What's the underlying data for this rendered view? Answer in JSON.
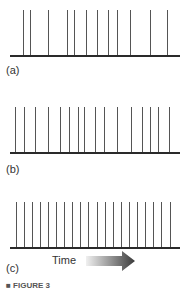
{
  "figure": {
    "panels": [
      {
        "label": "(a)",
        "description": "Irregularly spaced spikes",
        "spike_x": [
          23,
          30,
          48,
          67,
          74,
          86,
          97,
          108,
          117,
          130,
          150,
          167
        ]
      },
      {
        "label": "(b)",
        "description": "Moderately regular spikes",
        "spike_x": [
          15,
          24,
          35,
          48,
          60,
          69,
          78,
          84,
          95,
          104,
          117,
          131,
          142,
          150,
          158,
          169
        ]
      },
      {
        "label": "(c)",
        "description": "Evenly spaced spikes",
        "spike_x": [
          16,
          24,
          32,
          40,
          48,
          56,
          64,
          72,
          80,
          88,
          97,
          105,
          113,
          121,
          129,
          137,
          145,
          153,
          161,
          170
        ]
      }
    ],
    "time_axis": {
      "label": "Time",
      "direction": "right"
    },
    "caption": "■ FIGURE 3"
  },
  "chart_data": {
    "type": "spike-train",
    "panels": [
      {
        "label": "(a)",
        "spike_count": 12,
        "spacing": "irregular"
      },
      {
        "label": "(b)",
        "spike_count": 16,
        "spacing": "semi-regular"
      },
      {
        "label": "(c)",
        "spike_count": 20,
        "spacing": "regular"
      }
    ],
    "xlabel": "Time"
  },
  "colors": {
    "line": "#555555",
    "baseline": "#2a2a2a",
    "arrow_dark": "#3a3a3a",
    "arrow_light": "#f0f0f0"
  }
}
